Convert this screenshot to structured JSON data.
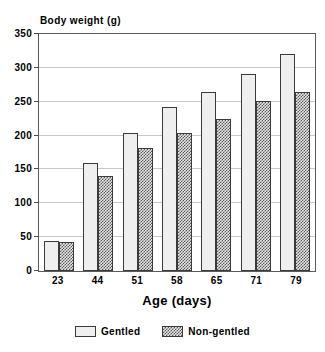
{
  "chart_data": {
    "type": "bar",
    "title": "",
    "ylabel": "Body weight (g)",
    "xlabel": "Age (days)",
    "categories": [
      "23",
      "44",
      "51",
      "58",
      "65",
      "71",
      "79"
    ],
    "series": [
      {
        "name": "Gentled",
        "values": [
          44,
          160,
          204,
          242,
          264,
          291,
          320
        ]
      },
      {
        "name": "Non-gentled",
        "values": [
          43,
          141,
          182,
          204,
          224,
          251,
          265
        ]
      }
    ],
    "ylim": [
      0,
      350
    ],
    "yticks": [
      0,
      50,
      100,
      150,
      200,
      250,
      300,
      350
    ],
    "ytick_labels": [
      "0",
      "50",
      "100",
      "150",
      "200",
      "250",
      "300",
      "350"
    ],
    "grid": true,
    "legend_position": "bottom"
  },
  "legend": {
    "items": [
      {
        "label": "Gentled",
        "swatch": "light-dotted-swatch"
      },
      {
        "label": "Non-gentled",
        "swatch": "dark-crosshatch-swatch"
      }
    ]
  },
  "colors": {
    "frame": "#5a5a5a",
    "grid": "#c8c8c8",
    "bar_border": "#3a3a3a",
    "gentled_fill": "#efefef",
    "nongentled_fill": "#555555",
    "background": "#ffffff"
  }
}
